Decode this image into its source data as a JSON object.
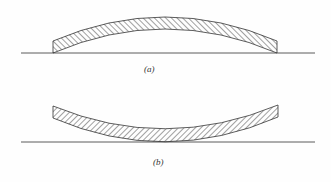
{
  "figure": {
    "panels": [
      {
        "id": "a",
        "label": "(a)",
        "description": "Convex (upward-bowed) hatched strip resting on baseline at its ends"
      },
      {
        "id": "b",
        "label": "(b)",
        "description": "Concave (downward-bowed) hatched strip touching baseline at its middle"
      }
    ],
    "colors": {
      "stroke": "#333333",
      "hatch": "#444444",
      "background": "#fefefe"
    }
  }
}
